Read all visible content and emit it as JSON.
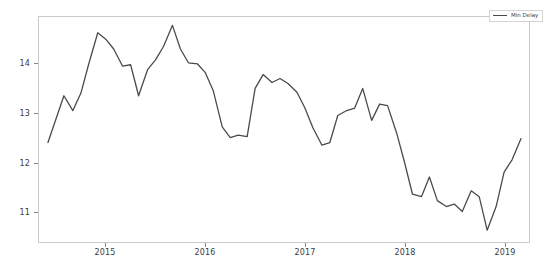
{
  "figure": {
    "background_color": "#ffffff",
    "plot_border_color": "#c9c9c9",
    "line_color": "#4a4a4a"
  },
  "legend": {
    "position": "upper right",
    "entries": [
      {
        "label": "Min Delay",
        "color": "#4a4a4a",
        "marker": "line"
      }
    ]
  },
  "chart_data": {
    "type": "line",
    "title": "",
    "xlabel": "",
    "ylabel": "",
    "xlim": [
      2014.33,
      2019.25
    ],
    "ylim": [
      10.38,
      14.95
    ],
    "grid": false,
    "legend_position": "upper right",
    "xticks": [
      2015,
      2016,
      2017,
      2018,
      2019
    ],
    "xtick_labels": [
      "2015",
      "2016",
      "2017",
      "2018",
      "2019"
    ],
    "yticks": [
      11,
      12,
      13,
      14
    ],
    "ytick_labels": [
      "11",
      "12",
      "13",
      "14"
    ],
    "series": [
      {
        "name": "Min Delay",
        "color": "#4a4a4a",
        "x": [
          2014.42,
          2014.58,
          2014.67,
          2014.75,
          2014.83,
          2014.92,
          2015.0,
          2015.08,
          2015.17,
          2015.25,
          2015.33,
          2015.42,
          2015.5,
          2015.58,
          2015.67,
          2015.75,
          2015.83,
          2015.92,
          2016.0,
          2016.08,
          2016.17,
          2016.25,
          2016.33,
          2016.42,
          2016.5,
          2016.58,
          2016.67,
          2016.75,
          2016.83,
          2016.92,
          2017.0,
          2017.08,
          2017.17,
          2017.25,
          2017.33,
          2017.42,
          2017.5,
          2017.58,
          2017.67,
          2017.75,
          2017.83,
          2017.92,
          2018.0,
          2018.08,
          2018.17,
          2018.25,
          2018.33,
          2018.42,
          2018.5,
          2018.58,
          2018.67,
          2018.75,
          2018.83,
          2018.92,
          2019.0,
          2019.08,
          2019.17
        ],
        "y": [
          12.4,
          13.35,
          13.05,
          13.4,
          14.0,
          14.63,
          14.5,
          14.3,
          13.95,
          13.98,
          13.35,
          13.88,
          14.08,
          14.35,
          14.78,
          14.3,
          14.02,
          14.0,
          13.82,
          13.45,
          12.72,
          12.5,
          12.55,
          12.52,
          13.5,
          13.78,
          13.62,
          13.7,
          13.6,
          13.42,
          13.1,
          12.7,
          12.35,
          12.4,
          12.95,
          13.05,
          13.1,
          13.5,
          12.85,
          13.18,
          13.15,
          12.6,
          12.0,
          11.35,
          11.3,
          11.7,
          11.22,
          11.1,
          11.15,
          11.0,
          11.42,
          11.3,
          10.62,
          11.1,
          11.8,
          12.05,
          12.48
        ]
      }
    ]
  }
}
